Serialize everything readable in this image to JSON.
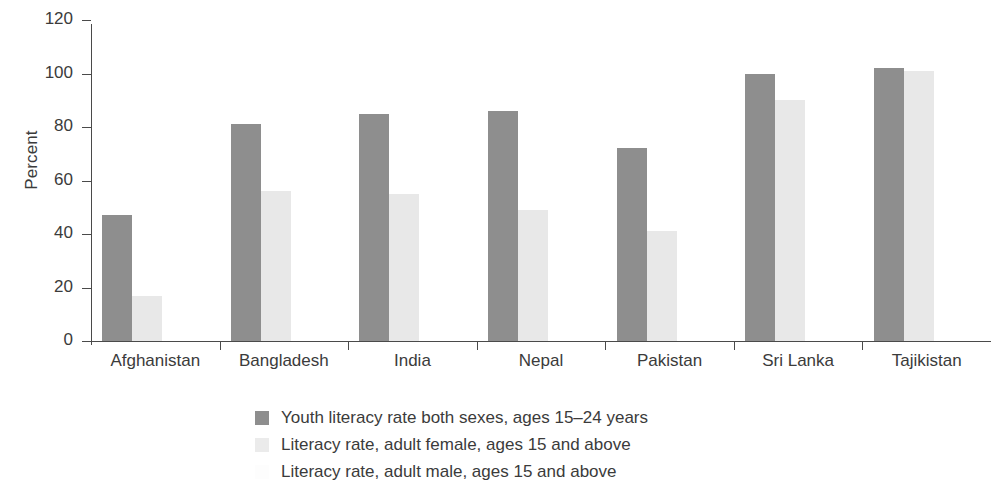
{
  "chart_data": {
    "type": "bar",
    "title": "",
    "xlabel": "",
    "ylabel": "Percent",
    "ylim": [
      0,
      120
    ],
    "yticks": [
      0,
      20,
      40,
      60,
      80,
      100,
      120
    ],
    "ytick_labels": [
      "0",
      "20",
      "40",
      "60",
      "80",
      "100",
      "120"
    ],
    "grid": false,
    "legend_position": "bottom",
    "categories": [
      "Afghanistan",
      "Bangladesh",
      "India",
      "Nepal",
      "Pakistan",
      "Sri Lanka",
      "Tajikistan"
    ],
    "series": [
      {
        "name": "Youth literacy rate both sexes, ages 15–24 years",
        "color": "#8e8e8e",
        "values": [
          47,
          81,
          85,
          86,
          72,
          100,
          102
        ]
      },
      {
        "name": "Literacy rate, adult female, ages 15 and above",
        "color": "#e8e8e8",
        "values": [
          17,
          56,
          55,
          49,
          41,
          90,
          101
        ]
      },
      {
        "name": "Literacy rate, adult male, ages 15 and above",
        "color": "#fdfdfd",
        "values": [
          0,
          0,
          0,
          0,
          0,
          0,
          0
        ]
      }
    ]
  },
  "legend": {
    "items": [
      {
        "label": "Youth literacy rate both sexes, ages 15–24 years",
        "swatch": "legend-swatch-youth"
      },
      {
        "label": "Literacy rate, adult female, ages 15 and above",
        "swatch": "legend-swatch-female"
      },
      {
        "label": "Literacy rate, adult male, ages 15 and above",
        "swatch": "legend-swatch-male"
      }
    ]
  }
}
